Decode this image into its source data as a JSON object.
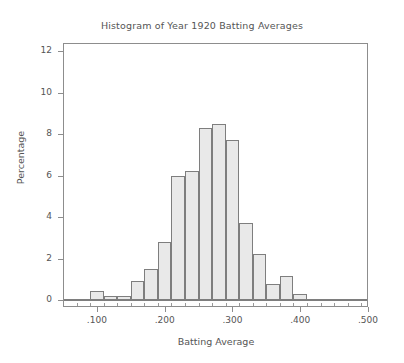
{
  "chart_data": {
    "type": "bar",
    "title": "Histogram of Year 1920 Batting Averages",
    "xlabel": "Batting Average",
    "ylabel": "Percentage",
    "grid": false,
    "legend": "none",
    "xlim": [
      0.05,
      0.5
    ],
    "ylim": [
      0,
      12.6
    ],
    "bin_width": 0.02,
    "x_tick_labels": [
      ".100",
      ".200",
      ".300",
      ".400",
      ".500"
    ],
    "x_tick_values": [
      0.1,
      0.2,
      0.3,
      0.4,
      0.5
    ],
    "y_tick_labels": [
      "0",
      "2",
      "4",
      "6",
      "8",
      "10",
      "12"
    ],
    "y_tick_values": [
      0,
      2,
      4,
      6,
      8,
      10,
      12
    ],
    "bin_starts": [
      0.09,
      0.11,
      0.13,
      0.15,
      0.17,
      0.19,
      0.21,
      0.23,
      0.25,
      0.27,
      0.29,
      0.31,
      0.33,
      0.35,
      0.37,
      0.39
    ],
    "categories": [
      ".090-.110",
      ".110-.130",
      ".130-.150",
      ".150-.170",
      ".170-.190",
      ".190-.210",
      ".210-.230",
      ".230-.250",
      ".250-.270",
      ".270-.290",
      ".290-.310",
      ".310-.330",
      ".330-.350",
      ".350-.370",
      ".370-.390",
      ".390-.410"
    ],
    "values": [
      0.45,
      0.2,
      0.2,
      0.9,
      1.5,
      2.8,
      6.0,
      6.2,
      8.3,
      8.5,
      7.7,
      3.7,
      2.2,
      0.75,
      1.15,
      0.3
    ],
    "colors": {
      "bar_fill": "#e9e9e9",
      "bar_border": "#7e7e7e",
      "axis": "#8d8d8d",
      "text": "#555555",
      "background": "#ffffff"
    }
  }
}
